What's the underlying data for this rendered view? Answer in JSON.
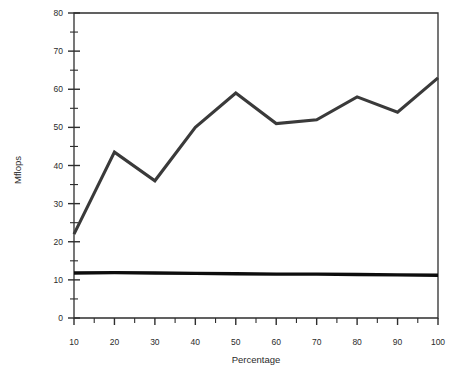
{
  "chart_data": {
    "type": "line",
    "title": "",
    "subtitle": "",
    "xlabel": "Percentage",
    "ylabel": "Mflops",
    "xlim": [
      10,
      100
    ],
    "ylim": [
      0,
      80
    ],
    "x_major_ticks": [
      10,
      20,
      30,
      40,
      50,
      60,
      70,
      80,
      90,
      100
    ],
    "x_minor_tick_step": 5,
    "y_major_ticks": [
      0,
      10,
      20,
      30,
      40,
      50,
      60,
      70,
      80
    ],
    "y_minor_tick_step": 5,
    "x_tick_labels": [
      "10",
      "20",
      "30",
      "40",
      "50",
      "60",
      "70",
      "80",
      "90",
      "100"
    ],
    "y_tick_labels": [
      "0",
      "10",
      "20",
      "30",
      "40",
      "50",
      "60",
      "70",
      "80"
    ],
    "grid": false,
    "legend": false,
    "legend_position": "none",
    "x": [
      10,
      20,
      30,
      40,
      50,
      60,
      70,
      80,
      90,
      100
    ],
    "series": [
      {
        "name": "upper-curve",
        "color": "#3a3a3a",
        "values": [
          22,
          43.5,
          36,
          50,
          59,
          51,
          52,
          58,
          54,
          63
        ]
      },
      {
        "name": "lower-flat-line",
        "color": "#0d0d0d",
        "values": [
          11.8,
          11.9,
          11.8,
          11.7,
          11.6,
          11.5,
          11.5,
          11.4,
          11.3,
          11.2
        ]
      }
    ],
    "annotations": []
  },
  "axis_titles": {
    "x": "Percentage",
    "y": "Mflops"
  }
}
